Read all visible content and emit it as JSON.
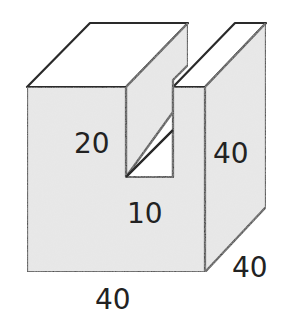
{
  "diagram": {
    "type": "3d-solid-with-slot",
    "colors": {
      "face_fill": "#e6e6e6",
      "top_fill": "#ffffff",
      "stroke": "#2a2a2a",
      "text": "#222222"
    },
    "labels": {
      "slot_depth": "20",
      "height": "40",
      "slot_width": "10",
      "width": "40",
      "depth": "40"
    }
  }
}
